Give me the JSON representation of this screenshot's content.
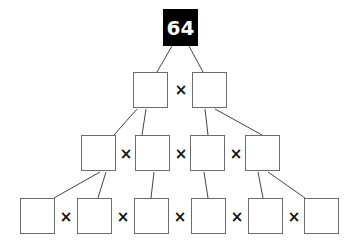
{
  "puzzle": {
    "top_value": "64",
    "operator": "×",
    "rows": [
      {
        "count": 2,
        "values": [
          "",
          ""
        ]
      },
      {
        "count": 4,
        "values": [
          "",
          "",
          "",
          ""
        ]
      },
      {
        "count": 6,
        "values": [
          "",
          "",
          "",
          "",
          "",
          ""
        ]
      }
    ]
  },
  "colors": {
    "top_fill": "#000000",
    "top_text": "#ffffff",
    "box_border": "#6b6b6b",
    "line": "#333333"
  }
}
